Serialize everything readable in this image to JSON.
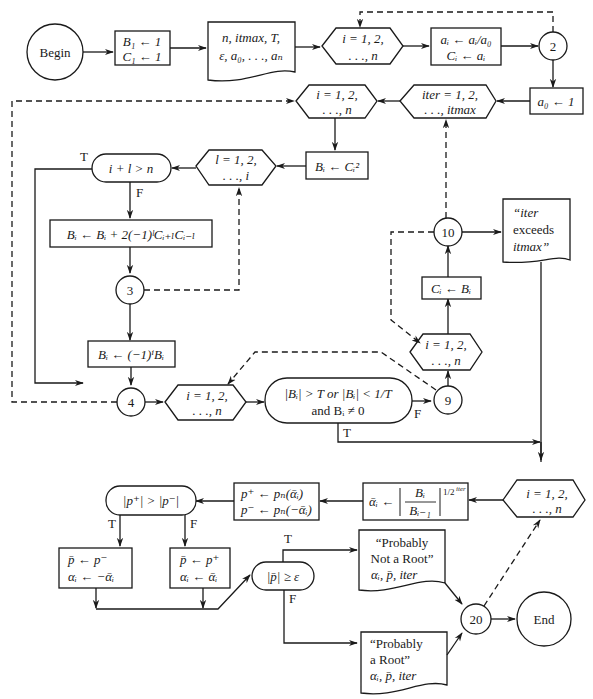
{
  "diagram": {
    "type": "flowchart",
    "nodes": {
      "begin": "Begin",
      "init": [
        "B₁ ← 1",
        "C₁ ← 1"
      ],
      "input": [
        "n, itmax, T,",
        "ε, a₀, . . ., aₙ"
      ],
      "loop_i_1": [
        "i = 1, 2,",
        ". . ., n"
      ],
      "normalize": [
        "aᵢ ← aᵢ/a₀",
        "Cᵢ ← aᵢ"
      ],
      "conn_2": "2",
      "set_a0": "a₀ ← 1",
      "loop_iter": [
        "iter = 1, 2,",
        ". . ., itmax"
      ],
      "loop_i_2": [
        "i = 1, 2,",
        ". . ., n"
      ],
      "square": "Bᵢ ← Cᵢ²",
      "loop_l": [
        "l = 1, 2,",
        ". . ., i"
      ],
      "decision_il": "i + l > n",
      "update_B": "Bᵢ ← Bᵢ + 2(−1)ˡCᵢ₊ₗCᵢ₋ₗ",
      "conn_3": "3",
      "sign_B": "Bᵢ ← (−1)ⁱBᵢ",
      "conn_4": "4",
      "loop_i_3": [
        "i = 1, 2,",
        ". . ., n"
      ],
      "decision_T": [
        "|Bᵢ| > T or |Bᵢ| < 1/T",
        "and Bᵢ ≠ 0"
      ],
      "conn_9": "9",
      "loop_i_4": [
        "i = 1, 2,",
        ". . ., n"
      ],
      "copy_C": "Cᵢ ← Bᵢ",
      "conn_10": "10",
      "output_exceeds": [
        "“iter",
        "exceeds",
        "itmax”"
      ],
      "loop_i_5": [
        "i = 1, 2,",
        ". . ., n"
      ],
      "alpha": "ᾱᵢ ← |Bᵢ / Bᵢ₋₁|^(1/2^iter)",
      "alpha_parts": {
        "lhs": "ᾱᵢ ←",
        "num": "Bᵢ",
        "den": "Bᵢ₋₁",
        "exp": "1/2",
        "exp_sup": "iter"
      },
      "eval_p": [
        "p⁺ ← pₙ(ᾱᵢ)",
        "p⁻ ← pₙ(−ᾱᵢ)"
      ],
      "decision_p": "|p⁺| > |p⁻|",
      "choose_minus": [
        "p̄ ← p⁻",
        "αᵢ ← −ᾱᵢ"
      ],
      "choose_plus": [
        "p̄ ← p⁺",
        "αᵢ ← ᾱᵢ"
      ],
      "decision_eps": "|p̄| ≥ ε",
      "output_not_root": [
        "“Probably",
        "Not a Root”",
        "αᵢ, p̄, iter"
      ],
      "output_root": [
        "“Probably",
        "a Root”",
        "αᵢ, p̄, iter"
      ],
      "conn_20": "20",
      "end": "End"
    },
    "labels": {
      "true": "T",
      "false": "F"
    }
  }
}
